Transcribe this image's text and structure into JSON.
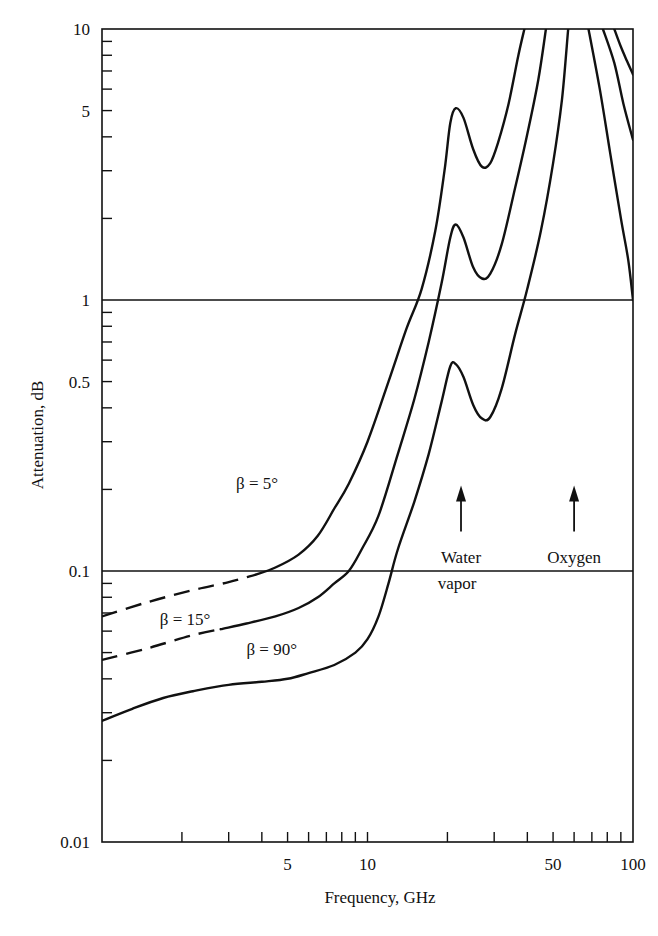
{
  "chart_data": {
    "type": "line",
    "title": "",
    "xlabel": "Frequency, GHz",
    "ylabel": "Attenuation, dB",
    "xscale": "log",
    "yscale": "log",
    "xlim": [
      1,
      100
    ],
    "ylim": [
      0.01,
      10
    ],
    "grid": {
      "horizontal_lines_at": [
        1,
        0.1
      ]
    },
    "x_tick_labels": [
      {
        "value": 5,
        "label": "5"
      },
      {
        "value": 10,
        "label": "10"
      },
      {
        "value": 50,
        "label": "50"
      },
      {
        "value": 100,
        "label": "100"
      }
    ],
    "x_minor_ticks": [
      2,
      3,
      4,
      5,
      6,
      7,
      8,
      9,
      10,
      20,
      30,
      40,
      50,
      60,
      70,
      80,
      90
    ],
    "y_tick_labels": [
      {
        "value": 10,
        "label": "10"
      },
      {
        "value": 5,
        "label": "5"
      },
      {
        "value": 1,
        "label": "1"
      },
      {
        "value": 0.5,
        "label": "0.5"
      },
      {
        "value": 0.1,
        "label": "0.1"
      },
      {
        "value": 0.01,
        "label": "0.01"
      }
    ],
    "y_minor_ticks": [
      9,
      8,
      7,
      6,
      5,
      4,
      3,
      2,
      0.9,
      0.8,
      0.7,
      0.6,
      0.5,
      0.4,
      0.3,
      0.2,
      0.09,
      0.08,
      0.07,
      0.06,
      0.05,
      0.04,
      0.03,
      0.02
    ],
    "series": [
      {
        "name": "β = 5°",
        "label": "β = 5°",
        "label_pos": [
          3.2,
          0.2
        ],
        "dashed_segment": [
          [
            1.0,
            0.068
          ],
          [
            1.5,
            0.077
          ],
          [
            2.2,
            0.085
          ],
          [
            3.0,
            0.091
          ],
          [
            3.8,
            0.097
          ]
        ],
        "points": [
          [
            3.8,
            0.097
          ],
          [
            4.5,
            0.103
          ],
          [
            5.5,
            0.115
          ],
          [
            6.5,
            0.135
          ],
          [
            7.5,
            0.17
          ],
          [
            8.5,
            0.21
          ],
          [
            10,
            0.3
          ],
          [
            12,
            0.5
          ],
          [
            14,
            0.78
          ],
          [
            16,
            1.1
          ],
          [
            18,
            1.8
          ],
          [
            19.5,
            3.0
          ],
          [
            20.5,
            4.5
          ],
          [
            21.5,
            5.1
          ],
          [
            23,
            4.7
          ],
          [
            25,
            3.6
          ],
          [
            27,
            3.1
          ],
          [
            29,
            3.2
          ],
          [
            31,
            3.8
          ],
          [
            34,
            5.3
          ],
          [
            37,
            8.0
          ],
          [
            39,
            10.0
          ]
        ],
        "points_right": [
          [
            85,
            10.0
          ],
          [
            90,
            8.6
          ],
          [
            95,
            7.6
          ],
          [
            100,
            6.8
          ]
        ]
      },
      {
        "name": "β = 15°",
        "label": "β = 15°",
        "label_pos": [
          1.65,
          0.063
        ],
        "dashed_segment": [
          [
            1.0,
            0.047
          ],
          [
            1.5,
            0.052
          ],
          [
            2.2,
            0.058
          ],
          [
            2.8,
            0.061
          ]
        ],
        "points": [
          [
            2.8,
            0.061
          ],
          [
            3.5,
            0.064
          ],
          [
            4.5,
            0.068
          ],
          [
            5.5,
            0.073
          ],
          [
            6.5,
            0.08
          ],
          [
            7.5,
            0.09
          ],
          [
            8.5,
            0.1
          ],
          [
            9.5,
            0.12
          ],
          [
            11,
            0.16
          ],
          [
            13,
            0.27
          ],
          [
            15,
            0.43
          ],
          [
            17,
            0.7
          ],
          [
            19,
            1.15
          ],
          [
            20.5,
            1.7
          ],
          [
            21.5,
            1.9
          ],
          [
            23,
            1.7
          ],
          [
            25,
            1.32
          ],
          [
            27,
            1.2
          ],
          [
            29,
            1.25
          ],
          [
            32,
            1.6
          ],
          [
            36,
            2.6
          ],
          [
            40,
            4.1
          ],
          [
            44,
            6.5
          ],
          [
            47,
            10.0
          ]
        ],
        "points_right": [
          [
            77,
            10.0
          ],
          [
            85,
            7.5
          ],
          [
            92,
            5.3
          ],
          [
            100,
            3.9
          ]
        ]
      },
      {
        "name": "β = 90°",
        "label": "β = 90°",
        "label_pos": [
          3.5,
          0.049
        ],
        "points": [
          [
            1.0,
            0.028
          ],
          [
            1.3,
            0.031
          ],
          [
            1.7,
            0.034
          ],
          [
            2.2,
            0.036
          ],
          [
            3.0,
            0.038
          ],
          [
            4.0,
            0.039
          ],
          [
            5.0,
            0.04
          ],
          [
            6.0,
            0.042
          ],
          [
            7.5,
            0.045
          ],
          [
            9.0,
            0.05
          ],
          [
            10.0,
            0.056
          ],
          [
            11,
            0.068
          ],
          [
            12,
            0.09
          ],
          [
            13,
            0.12
          ],
          [
            15,
            0.18
          ],
          [
            17,
            0.27
          ],
          [
            19,
            0.42
          ],
          [
            20.5,
            0.57
          ],
          [
            21.5,
            0.58
          ],
          [
            23,
            0.52
          ],
          [
            25,
            0.41
          ],
          [
            27,
            0.365
          ],
          [
            29,
            0.37
          ],
          [
            32,
            0.47
          ],
          [
            36,
            0.75
          ],
          [
            40,
            1.1
          ],
          [
            45,
            1.8
          ],
          [
            50,
            3.2
          ],
          [
            54,
            5.5
          ],
          [
            57,
            10.0
          ]
        ],
        "points_right": [
          [
            68,
            10.0
          ],
          [
            75,
            6.0
          ],
          [
            82,
            3.5
          ],
          [
            90,
            2.0
          ],
          [
            96,
            1.4
          ],
          [
            100,
            1.0
          ]
        ]
      }
    ],
    "annotations": [
      {
        "text": "Water",
        "text2": "vapor",
        "arrow_x": 22.5,
        "arrow_from_y": 0.14,
        "arrow_to_y": 0.2
      },
      {
        "text": "Oxygen",
        "arrow_x": 60,
        "arrow_from_y": 0.14,
        "arrow_to_y": 0.2
      }
    ]
  }
}
